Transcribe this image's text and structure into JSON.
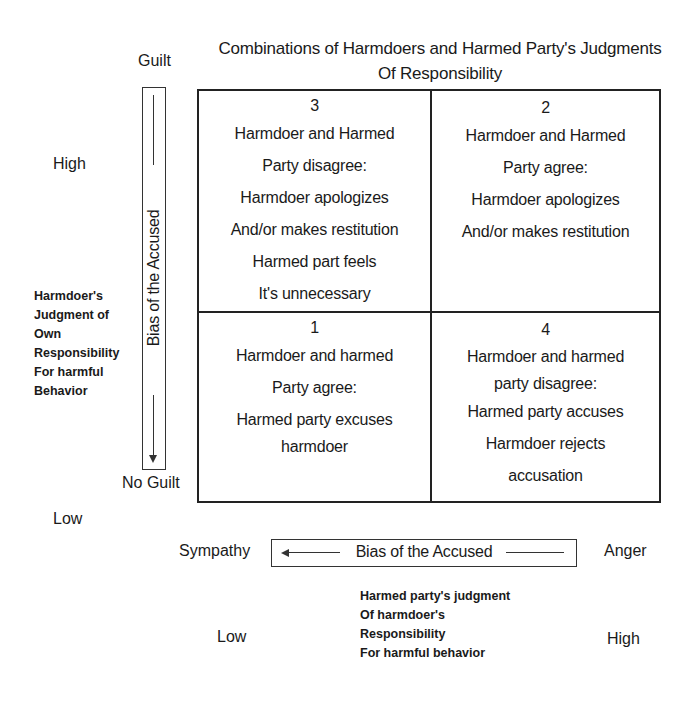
{
  "title": {
    "line1": "Combinations of Harmdoers and Harmed Party's Judgments",
    "line2": "Of Responsibility"
  },
  "y_axis": {
    "top_label": "Guilt",
    "bottom_label": "No Guilt",
    "high": "High",
    "low": "Low",
    "bias_label": "Bias of the Accused",
    "description": [
      "Harmdoer's",
      "Judgment of",
      "Own",
      "Responsibility",
      "For harmful",
      "Behavior"
    ]
  },
  "x_axis": {
    "left_label": "Sympathy",
    "right_label": "Anger",
    "bias_label": "Bias of the Accused",
    "low": "Low",
    "high": "High",
    "description": [
      "Harmed party's judgment",
      "Of harmdoer's",
      "Responsibility",
      "For harmful behavior"
    ]
  },
  "quadrants": {
    "top_left": {
      "number": "3",
      "lines": [
        "Harmdoer and Harmed",
        "Party disagree:",
        "Harmdoer apologizes",
        "And/or makes restitution",
        "Harmed part feels",
        "It's unnecessary"
      ]
    },
    "top_right": {
      "number": "2",
      "lines": [
        "Harmdoer and Harmed",
        "Party agree:",
        "Harmdoer apologizes",
        "And/or makes restitution"
      ]
    },
    "bottom_left": {
      "number": "1",
      "lines": [
        "Harmdoer and harmed",
        "Party agree:",
        "Harmed party excuses",
        "harmdoer"
      ]
    },
    "bottom_right": {
      "number": "4",
      "lines": [
        "Harmdoer and harmed",
        "party disagree:",
        "Harmed party accuses",
        "Harmdoer rejects",
        "accusation"
      ]
    }
  }
}
